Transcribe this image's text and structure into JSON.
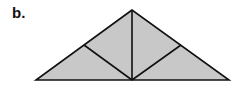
{
  "figure": {
    "label": "b.",
    "fill_color": "#c8c8c8",
    "stroke_color": "#111111",
    "shape": "isosceles triangle subdivided into four right triangles",
    "points": {
      "apex": [
        132,
        10
      ],
      "base_left": [
        36,
        80
      ],
      "base_right": [
        229,
        80
      ],
      "base_mid": [
        132,
        80
      ],
      "left_leg_mid": [
        84,
        45
      ],
      "right_leg_mid": [
        181,
        45
      ]
    }
  }
}
